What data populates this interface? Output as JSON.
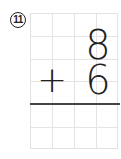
{
  "problem": {
    "number_label": "11",
    "top_digit": "8",
    "operator": "+",
    "bottom_digit": "6",
    "answer": ""
  },
  "grid": {
    "columns": 4,
    "rows": 6,
    "line_color": "#e4e4e4",
    "answer_line_color": "#444444"
  }
}
